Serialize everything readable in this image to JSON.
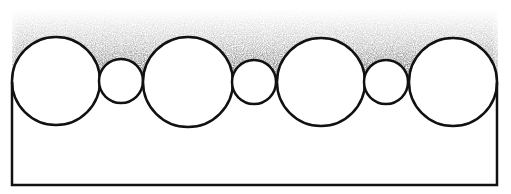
{
  "diagram": {
    "colors": {
      "background": "#ffffff",
      "stroke": "#111111",
      "shade": "#000000"
    },
    "frame": {
      "left": 12,
      "right": 497,
      "top": 82,
      "bottom": 185
    },
    "circles": [
      {
        "cx": 56,
        "cy": 81,
        "r": 44,
        "size": "large"
      },
      {
        "cx": 121,
        "cy": 81,
        "r": 22,
        "size": "small"
      },
      {
        "cx": 188,
        "cy": 82,
        "r": 45,
        "size": "large"
      },
      {
        "cx": 254,
        "cy": 82,
        "r": 22,
        "size": "small"
      },
      {
        "cx": 321,
        "cy": 82,
        "r": 44,
        "size": "large"
      },
      {
        "cx": 386,
        "cy": 82,
        "r": 22,
        "size": "small"
      },
      {
        "cx": 453,
        "cy": 82,
        "r": 44,
        "size": "large"
      }
    ]
  }
}
